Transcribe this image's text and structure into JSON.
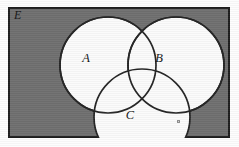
{
  "figure": {
    "type": "venn-diagram",
    "set_count": 3,
    "universal_set_label": "E",
    "background_color": "#6f6f6f",
    "border_color": "#1e1e1e",
    "circle_fill_color": "#fbfbfb",
    "circle_stroke_color": "#242424",
    "sets": [
      {
        "id": "A",
        "label": "A",
        "cx": 100,
        "cy": 58,
        "r": 48,
        "label_x": 78,
        "label_y": 50
      },
      {
        "id": "B",
        "label": "B",
        "cx": 168,
        "cy": 58,
        "r": 48,
        "label_x": 150,
        "label_y": 50
      },
      {
        "id": "C",
        "label": "C",
        "cx": 134,
        "cy": 110,
        "r": 48,
        "label_x": 120,
        "label_y": 114
      }
    ],
    "artifacts": [
      {
        "name": "speck",
        "x": 177,
        "y": 120
      }
    ]
  }
}
